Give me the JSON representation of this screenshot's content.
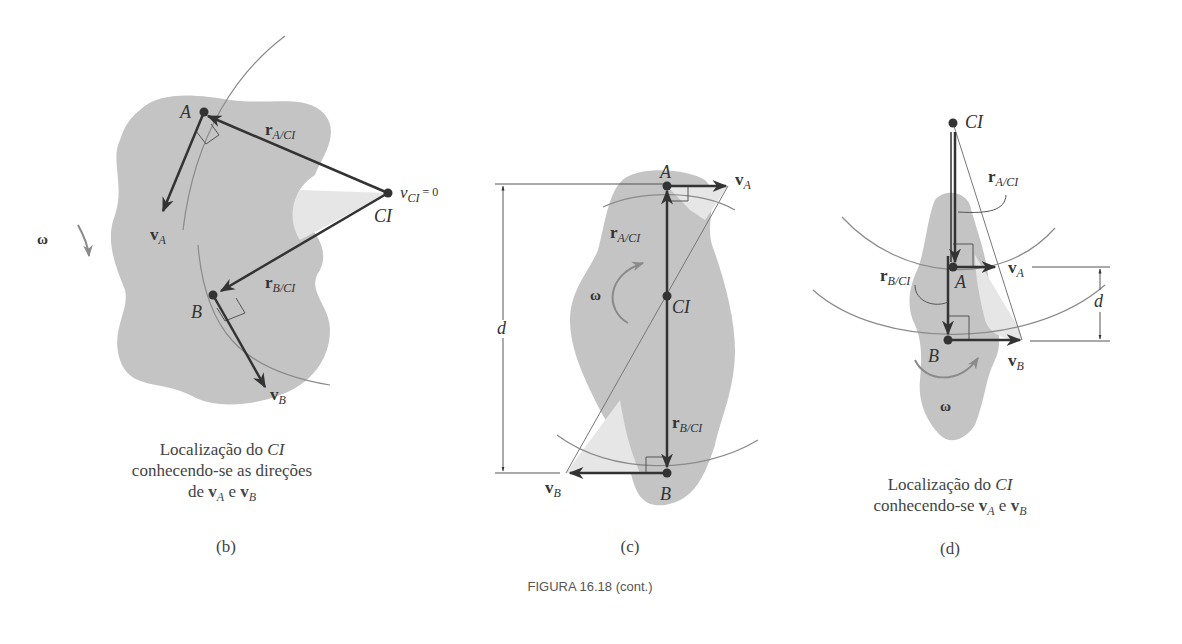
{
  "figure_caption": "FIGURA 16.18 (cont.)",
  "colors": {
    "body_fill": "#c4c4c4",
    "triangle_fill": "#e6e6e6",
    "vector": "#333333",
    "arc": "#8a8a8a",
    "omega_arrow": "#8a8a8a"
  },
  "panels": {
    "b": {
      "tag": "(b)",
      "labels": {
        "A": "A",
        "B": "B",
        "CI": "CI",
        "vCI": "v",
        "vCI_sub": "CI",
        "vCI_eq": " = 0",
        "rA": "r",
        "rA_sub": "A/CI",
        "rB": "r",
        "rB_sub": "B/CI",
        "vA": "v",
        "vA_sub": "A",
        "vB": "v",
        "vB_sub": "B",
        "omega": "ω"
      },
      "caption": {
        "line1": "Localização do ",
        "line1_it": "CI",
        "line2": "conhecendo-se as direções",
        "line3_pre": "de ",
        "vA": "v",
        "vA_sub": "A",
        "and": " e ",
        "vB": "v",
        "vB_sub": "B"
      }
    },
    "c": {
      "tag": "(c)",
      "labels": {
        "A": "A",
        "B": "B",
        "CI": "CI",
        "d": "d",
        "rA": "r",
        "rA_sub": "A/CI",
        "rB": "r",
        "rB_sub": "B/CI",
        "vA": "v",
        "vA_sub": "A",
        "vB": "v",
        "vB_sub": "B",
        "omega": "ω"
      }
    },
    "d": {
      "tag": "(d)",
      "labels": {
        "A": "A",
        "B": "B",
        "CI": "CI",
        "d": "d",
        "rA": "r",
        "rA_sub": "A/CI",
        "rB": "r",
        "rB_sub": "B/CI",
        "vA": "v",
        "vA_sub": "A",
        "vB": "v",
        "vB_sub": "B",
        "omega": "ω"
      },
      "caption": {
        "line1": "Localização do ",
        "line1_it": "CI",
        "line2_pre": "conhecendo-se ",
        "vA": "v",
        "vA_sub": "A",
        "and": " e ",
        "vB": "v",
        "vB_sub": "B"
      }
    }
  }
}
